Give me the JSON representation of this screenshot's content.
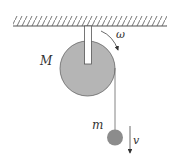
{
  "diagram": {
    "labels": {
      "pulley_mass": "M",
      "angular_velocity": "ω",
      "hanging_mass": "m",
      "velocity": "v"
    },
    "icons": {
      "ceiling": "hatched-ceiling-icon",
      "pulley": "disk-icon",
      "mass": "ball-icon",
      "rotation_arrow": "curved-arrow-icon",
      "velocity_arrow": "down-arrow-icon"
    },
    "colors": {
      "pulley_fill": "#b5b5b5",
      "ball_fill": "#8c8c8c",
      "line": "#555555",
      "hatch": "#777777",
      "background": "#ffffff"
    }
  }
}
